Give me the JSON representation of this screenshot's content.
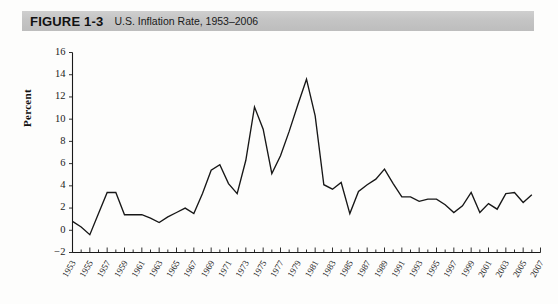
{
  "figure": {
    "label": "FIGURE 1-3",
    "title": "U.S. Inflation Rate, 1953–2006"
  },
  "chart_data": {
    "type": "line",
    "title": "U.S. Inflation Rate, 1953–2006",
    "xlabel": "",
    "ylabel": "Percent",
    "ylim": [
      -2,
      16
    ],
    "xlim": [
      1953,
      2007
    ],
    "ytick_labels": [
      "16",
      "14",
      "12",
      "10",
      "8",
      "6",
      "4",
      "2",
      "0",
      "−2"
    ],
    "ytick_values": [
      16,
      14,
      12,
      10,
      8,
      6,
      4,
      2,
      0,
      -2
    ],
    "xtick_labels": [
      "1953",
      "1955",
      "1957",
      "1959",
      "1961",
      "1963",
      "1965",
      "1967",
      "1969",
      "1971",
      "1973",
      "1975",
      "1977",
      "1979",
      "1981",
      "1983",
      "1985",
      "1987",
      "1989",
      "1991",
      "1993",
      "1995",
      "1997",
      "1999",
      "2001",
      "2003",
      "2005",
      "2007"
    ],
    "xtick_values": [
      1953,
      1955,
      1957,
      1959,
      1961,
      1963,
      1965,
      1967,
      1969,
      1971,
      1973,
      1975,
      1977,
      1979,
      1981,
      1983,
      1985,
      1987,
      1989,
      1991,
      1993,
      1995,
      1997,
      1999,
      2001,
      2003,
      2005,
      2007
    ],
    "minor_xticks_every": 1,
    "grid": false,
    "legend": false,
    "line_color": "#171717",
    "series": [
      {
        "name": "U.S. Inflation Rate",
        "x": [
          1953,
          1954,
          1955,
          1956,
          1957,
          1958,
          1959,
          1960,
          1961,
          1962,
          1963,
          1964,
          1965,
          1966,
          1967,
          1968,
          1969,
          1970,
          1971,
          1972,
          1973,
          1974,
          1975,
          1976,
          1977,
          1978,
          1979,
          1980,
          1981,
          1982,
          1983,
          1984,
          1985,
          1986,
          1987,
          1988,
          1989,
          1990,
          1991,
          1992,
          1993,
          1994,
          1995,
          1996,
          1997,
          1998,
          1999,
          2000,
          2001,
          2002,
          2003,
          2004,
          2005,
          2006
        ],
        "values": [
          0.8,
          0.3,
          -0.4,
          1.5,
          3.4,
          3.4,
          1.4,
          1.4,
          1.4,
          1.1,
          0.7,
          1.2,
          1.6,
          2.0,
          1.5,
          3.3,
          5.4,
          5.9,
          4.2,
          3.3,
          6.3,
          11.1,
          9.1,
          5.1,
          6.7,
          8.9,
          11.3,
          13.6,
          10.3,
          4.1,
          3.7,
          4.3,
          1.5,
          3.5,
          4.1,
          4.6,
          5.5,
          4.2,
          3.0,
          3.0,
          2.6,
          2.8,
          2.8,
          2.3,
          1.6,
          2.2,
          3.4,
          1.6,
          2.4,
          1.9,
          3.3,
          3.4,
          2.5,
          3.2
        ]
      }
    ]
  }
}
